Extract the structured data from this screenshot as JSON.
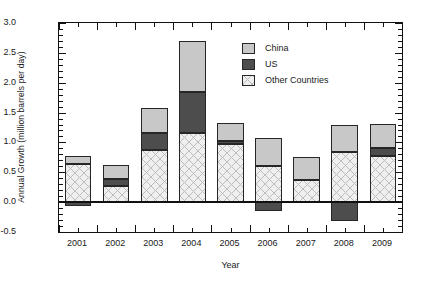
{
  "chart_data": {
    "type": "bar",
    "subtype": "stacked-bar",
    "title": "",
    "xlabel": "Year",
    "ylabel": "Annual Growth (million barrels per day)",
    "categories": [
      "2001",
      "2002",
      "2003",
      "2004",
      "2005",
      "2006",
      "2007",
      "2008",
      "2009"
    ],
    "series": [
      {
        "name": "Other Countries",
        "values": [
          0.64,
          0.27,
          0.88,
          1.15,
          0.98,
          0.6,
          0.37,
          0.84,
          0.77
        ]
      },
      {
        "name": "US",
        "values": [
          -0.06,
          0.11,
          0.27,
          0.7,
          0.05,
          -0.14,
          0.0,
          -0.32,
          0.14
        ]
      },
      {
        "name": "China",
        "values": [
          0.14,
          0.25,
          0.43,
          0.85,
          0.29,
          0.48,
          0.39,
          0.45,
          0.4
        ]
      }
    ],
    "ylim": [
      -0.5,
      3.0
    ],
    "ytick_labels": [
      "-0.5",
      "0.0",
      "0.5",
      "1.0",
      "1.5",
      "2.0",
      "2.5",
      "3.0"
    ],
    "ytick_values": [
      -0.5,
      0.0,
      0.5,
      1.0,
      1.5,
      2.0,
      2.5,
      3.0
    ],
    "yminor_step": 0.1,
    "grid": false,
    "legend_position": "top-right",
    "colors": {
      "china": "#c8c8c8",
      "us": "#4d4d4d",
      "other_countries": "#efefef",
      "axis": "#111111",
      "segment_border": "#262626"
    }
  },
  "legend": {
    "items": [
      {
        "label": "China",
        "style": "china"
      },
      {
        "label": "US",
        "style": "us"
      },
      {
        "label": "Other Countries",
        "style": "other"
      }
    ]
  }
}
